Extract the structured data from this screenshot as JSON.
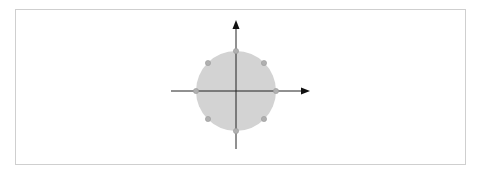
{
  "diagram": {
    "type": "constellation",
    "colors": {
      "frame_border": "#cfcfcf",
      "disk_fill": "#d3d3d3",
      "axis": "#222222",
      "point_fill": "#b0b0b0",
      "point_stroke": "#9a9a9a"
    },
    "center": {
      "x": 236,
      "y": 91
    },
    "radius": 40,
    "x_axis": {
      "from": 171,
      "to": 310,
      "arrow": "right"
    },
    "y_axis": {
      "from": 149,
      "to": 20,
      "arrow": "up"
    },
    "points": [
      {
        "angle_deg": 0,
        "x": 276,
        "y": 91
      },
      {
        "angle_deg": 45,
        "x": 264,
        "y": 63
      },
      {
        "angle_deg": 90,
        "x": 236,
        "y": 51
      },
      {
        "angle_deg": 135,
        "x": 208,
        "y": 63
      },
      {
        "angle_deg": 180,
        "x": 196,
        "y": 91
      },
      {
        "angle_deg": 225,
        "x": 208,
        "y": 119
      },
      {
        "angle_deg": 270,
        "x": 236,
        "y": 131
      },
      {
        "angle_deg": 315,
        "x": 264,
        "y": 119
      }
    ]
  }
}
